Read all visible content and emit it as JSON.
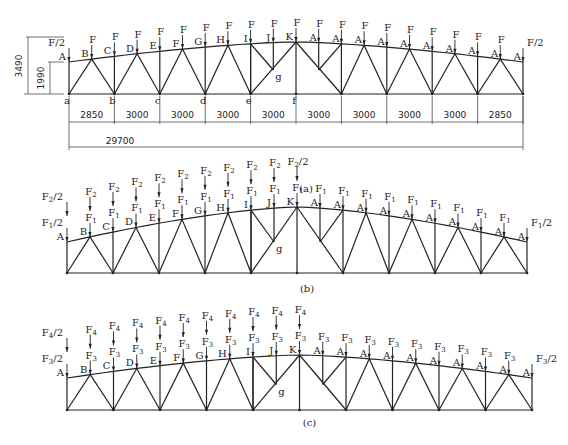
{
  "diagrams": [
    {
      "caption": "(a)",
      "top_node_labels": [
        "A",
        "B",
        "C",
        "D",
        "E",
        "F",
        "G",
        "H",
        "I",
        "J",
        "K",
        "A",
        "A",
        "A",
        "A",
        "A",
        "A",
        "A",
        "A",
        "A",
        "A"
      ],
      "bottom_node_labels": [
        "a",
        "b",
        "c",
        "d",
        "e",
        "f"
      ],
      "inner_node_label": "g",
      "loads_upper": [],
      "loads_lower": [
        "F/2",
        "F",
        "F",
        "F",
        "F",
        "F",
        "F",
        "F",
        "F",
        "F",
        "F",
        "F",
        "F",
        "F",
        "F",
        "F",
        "F",
        "F",
        "F",
        "F",
        "F/2"
      ],
      "dimensions": {
        "height_total": "3490",
        "height_end": "1990",
        "spans": [
          "2850",
          "3000",
          "3000",
          "3000",
          "3000",
          "3000",
          "3000",
          "3000",
          "3000",
          "2850"
        ],
        "total_span": "29700"
      }
    },
    {
      "caption": "(b)",
      "top_node_labels": [
        "A",
        "B",
        "C",
        "D",
        "E",
        "F",
        "G",
        "H",
        "I",
        "J",
        "K",
        "A",
        "A",
        "A",
        "A",
        "A",
        "A",
        "A",
        "A",
        "A",
        "A"
      ],
      "inner_node_label": "g",
      "loads_upper": [
        "F2/2",
        "F2",
        "F2",
        "F2",
        "F2",
        "F2",
        "F2",
        "F2",
        "F2",
        "F2",
        "F2/2"
      ],
      "loads_lower": [
        "F1/2",
        "F1",
        "F1",
        "F1",
        "F1",
        "F1",
        "F1",
        "F1",
        "F1",
        "F1",
        "F1",
        "F1",
        "F1",
        "F1",
        "F1",
        "F1",
        "F1",
        "F1",
        "F1",
        "F1",
        "F1/2"
      ]
    },
    {
      "caption": "(c)",
      "top_node_labels": [
        "A",
        "B",
        "C",
        "D",
        "E",
        "F",
        "G",
        "H",
        "I",
        "J",
        "K",
        "A",
        "A",
        "A",
        "A",
        "A",
        "A",
        "A",
        "A",
        "A",
        "A"
      ],
      "inner_node_label": "g",
      "loads_upper": [
        "F4/2",
        "F4",
        "F4",
        "F4",
        "F4",
        "F4",
        "F4",
        "F4",
        "F4",
        "F4",
        "F4"
      ],
      "loads_lower": [
        "F3/2",
        "F3",
        "F3",
        "F3",
        "F3",
        "F3",
        "F3",
        "F3",
        "F3",
        "F3",
        "F3",
        "F3",
        "F3",
        "F3",
        "F3",
        "F3",
        "F3",
        "F3",
        "F3",
        "F3",
        "F3/2"
      ]
    }
  ]
}
